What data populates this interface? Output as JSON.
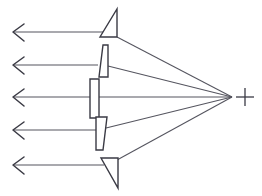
{
  "figure": {
    "background_color": "#ffffff",
    "stroke_color": "#3a3a44",
    "prism_fill_color": "#ffffff",
    "ray_stroke_color": "#55555f",
    "width": 262,
    "height": 196
  },
  "focus": {
    "label": "+",
    "marker_name": "focal-point-plus",
    "x": 245,
    "y": 97,
    "arm_length": 9,
    "convergence_x": 232,
    "convergence_y": 97
  },
  "chart_data": {
    "type": "diagram",
    "xlabel": "",
    "ylabel": "",
    "ray_count": 5,
    "prism_count": 5,
    "rays": [
      {
        "name": "ray-1",
        "y": 32,
        "arrow_tip_x": 13,
        "tail_x": 106,
        "incident_from": "prism-1"
      },
      {
        "name": "ray-2",
        "y": 65,
        "arrow_tip_x": 13,
        "tail_x": 98,
        "incident_from": "prism-2"
      },
      {
        "name": "ray-3",
        "y": 97,
        "arrow_tip_x": 13,
        "tail_x": 92,
        "incident_from": "prism-3"
      },
      {
        "name": "ray-4",
        "y": 130,
        "arrow_tip_x": 13,
        "tail_x": 96,
        "incident_from": "prism-4"
      },
      {
        "name": "ray-5",
        "y": 165,
        "arrow_tip_x": 13,
        "tail_x": 104,
        "incident_from": "prism-5"
      }
    ],
    "converging_rays": [
      {
        "name": "converging-ray-1",
        "from_x": 117,
        "from_y": 37,
        "to_x": 232,
        "to_y": 97
      },
      {
        "name": "converging-ray-2",
        "from_x": 108,
        "from_y": 66,
        "to_x": 232,
        "to_y": 97
      },
      {
        "name": "converging-ray-3",
        "from_x": 99,
        "from_y": 97,
        "to_x": 232,
        "to_y": 97
      },
      {
        "name": "converging-ray-4",
        "from_x": 106,
        "from_y": 128,
        "to_x": 232,
        "to_y": 97
      },
      {
        "name": "converging-ray-5",
        "from_x": 117,
        "from_y": 160,
        "to_x": 232,
        "to_y": 97
      }
    ],
    "prisms": [
      {
        "name": "prism-1",
        "shape": "triangle",
        "description": "apex top, vertical right face, horizontal base",
        "points": "117,9 117,37 100,37"
      },
      {
        "name": "prism-2",
        "shape": "trapezoid",
        "description": "wedge wide at top narrowing toward bottom",
        "points": "108,45 108,77 99,77 103,45"
      },
      {
        "name": "prism-3",
        "shape": "rectangle",
        "description": "vertical slab, parallel faces",
        "points": "90,79 99,79 99,118 90,118"
      },
      {
        "name": "prism-4",
        "shape": "trapezoid",
        "description": "wedge wide at top narrowing toward bottom",
        "points": "96,117 107,117 103,150 96,150"
      },
      {
        "name": "prism-5",
        "shape": "triangle",
        "description": "horizontal top edge, vertical right face, apex bottom",
        "points": "101,158 118,158 118,188"
      }
    ],
    "arrow_heads": [
      {
        "name": "arrow-head-1",
        "points": "24,24 13,32 24,41"
      },
      {
        "name": "arrow-head-2",
        "points": "24,57 13,65 24,74"
      },
      {
        "name": "arrow-head-3",
        "points": "24,89 13,97 24,106"
      },
      {
        "name": "arrow-head-4",
        "points": "24,122 13,130 24,139"
      },
      {
        "name": "arrow-head-5",
        "points": "24,157 13,165 24,174"
      }
    ],
    "legend": [],
    "annotations": [
      {
        "name": "focal-point-plus",
        "text": "+",
        "x": 245,
        "y": 97
      }
    ]
  }
}
